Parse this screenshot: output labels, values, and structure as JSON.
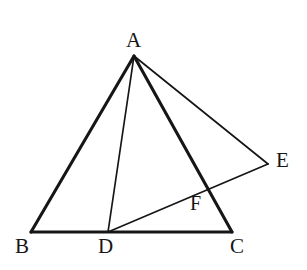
{
  "figure": {
    "kind": "geometry-diagram",
    "background_color": "#ffffff",
    "stroke_color": "#161616",
    "label_color": "#161616",
    "canvas": {
      "width": 307,
      "height": 270
    },
    "points": [
      {
        "id": "A",
        "label": "A",
        "x": 134,
        "y": 56,
        "label_x": 126,
        "label_y": 30,
        "font_size": 21
      },
      {
        "id": "B",
        "label": "B",
        "x": 31,
        "y": 232,
        "label_x": 15,
        "label_y": 236,
        "font_size": 21
      },
      {
        "id": "C",
        "label": "C",
        "x": 232,
        "y": 232,
        "label_x": 230,
        "label_y": 236,
        "font_size": 21
      },
      {
        "id": "D",
        "label": "D",
        "x": 108,
        "y": 232,
        "label_x": 98,
        "label_y": 236,
        "font_size": 21
      },
      {
        "id": "E",
        "label": "E",
        "x": 268,
        "y": 164,
        "label_x": 276,
        "label_y": 150,
        "font_size": 21
      },
      {
        "id": "F",
        "label": "F",
        "x": 200,
        "y": 188,
        "label_x": 190,
        "label_y": 193,
        "font_size": 20
      }
    ],
    "segments": [
      {
        "id": "AB",
        "from": "A",
        "to": "B",
        "x1": 134,
        "y1": 56,
        "x2": 31,
        "y2": 232,
        "width": 3.1,
        "style": "thick"
      },
      {
        "id": "BC",
        "from": "B",
        "to": "C",
        "x1": 31,
        "y1": 232,
        "x2": 232,
        "y2": 232,
        "width": 3.1,
        "style": "thick"
      },
      {
        "id": "AC",
        "from": "A",
        "to": "C",
        "x1": 134,
        "y1": 56,
        "x2": 232,
        "y2": 232,
        "width": 3.1,
        "style": "thick"
      },
      {
        "id": "AD",
        "from": "A",
        "to": "D",
        "x1": 134,
        "y1": 56,
        "x2": 108,
        "y2": 232,
        "width": 1.7,
        "style": "thin"
      },
      {
        "id": "AE",
        "from": "A",
        "to": "E",
        "x1": 134,
        "y1": 56,
        "x2": 268,
        "y2": 164,
        "width": 1.7,
        "style": "thin"
      },
      {
        "id": "DE",
        "from": "D",
        "to": "E",
        "x1": 108,
        "y1": 232,
        "x2": 268,
        "y2": 164,
        "width": 1.7,
        "style": "thin"
      }
    ]
  }
}
